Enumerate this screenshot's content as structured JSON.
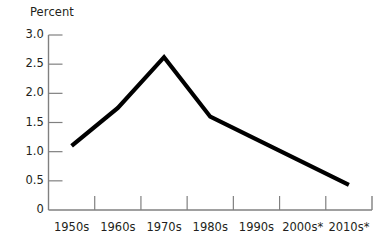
{
  "chart_data": {
    "type": "line",
    "title": "",
    "subtitle": "",
    "xlabel": "",
    "ylabel": "Percent",
    "categories": [
      "1950s",
      "1960s",
      "1970s",
      "1980s",
      "1990s",
      "2000s*",
      "2010s*"
    ],
    "values": [
      1.1,
      1.75,
      2.62,
      1.6,
      1.21,
      0.82,
      0.43
    ],
    "series": [
      {
        "name": "Percent",
        "values": [
          1.1,
          1.75,
          2.62,
          1.6,
          1.21,
          0.82,
          0.43
        ]
      }
    ],
    "ylim": [
      0,
      3.0
    ],
    "ytick_labels": [
      "3.0",
      "2.5",
      "2.0",
      "1.5",
      "1.0",
      "0.5",
      "0"
    ],
    "ytick_values": [
      3.0,
      2.5,
      2.0,
      1.5,
      1.0,
      0.5,
      0
    ],
    "grid": false,
    "legend": false,
    "legend_position": "none",
    "line_color": "#000000",
    "axis_color": "#808080",
    "text_color": "#231f20",
    "background_color": "#ffffff",
    "annotations": []
  },
  "footnote": ""
}
